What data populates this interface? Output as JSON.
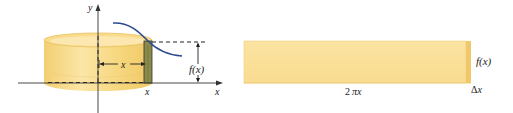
{
  "left_figure": {
    "axis_labels": {
      "y": "y",
      "x": "x"
    },
    "radius_label": "x",
    "shell_position_label": "x",
    "height_label": "f(x)",
    "colors": {
      "cylinder_fill": "#f6d77e",
      "cylinder_light": "#fbe6a6",
      "shell_fill": "#8a8a4a",
      "curve": "#2b4a8c",
      "axis": "#333333"
    }
  },
  "right_figure": {
    "length_label": "2πx",
    "length_label_parts": {
      "coef": "2",
      "pi": "π",
      "var": "x"
    },
    "height_label": "f(x)",
    "thickness_label": "Δx",
    "thickness_label_parts": {
      "delta": "Δ",
      "var": "x"
    },
    "colors": {
      "slab_fill": "#fbe3a0",
      "slab_edge": "#f0c86a"
    }
  }
}
